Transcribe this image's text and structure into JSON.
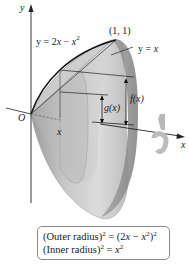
{
  "figure": {
    "type": "solid-of-revolution-washer-method",
    "colors": {
      "curve": "#111111",
      "solid_light": "#d9d9d9",
      "solid_mid": "#b8b8b8",
      "solid_dark": "#8e8e8e",
      "axis": "#222222",
      "legend_border": "#8a8a8a"
    }
  },
  "axes": {
    "y_label": "y",
    "x_label": "x",
    "origin_label": "O"
  },
  "curves": {
    "upper": {
      "label_lhs": "y = 2",
      "label_var": "x",
      "label_mid": " − ",
      "label_var2": "x",
      "label_exp": "2"
    },
    "lower": {
      "label_lhs": "y = ",
      "label_var": "x"
    }
  },
  "points": {
    "intersection": "(1, 1)"
  },
  "annotations": {
    "outer_fn": "f(x)",
    "inner_fn": "g(x)",
    "x_marker": "x",
    "rotation_icon": "rotation-arrow-icon"
  },
  "legend": {
    "outer": {
      "prefix": "(Outer radius)",
      "exp": "2",
      "eq": " = (2",
      "var": "x",
      "minus": " − ",
      "var2": "x",
      "exp2": "2",
      "close": ")",
      "exp3": "2"
    },
    "inner": {
      "prefix": "(Inner radius)",
      "exp": "2",
      "eq": " = ",
      "var": "x",
      "exp2": "2"
    }
  }
}
